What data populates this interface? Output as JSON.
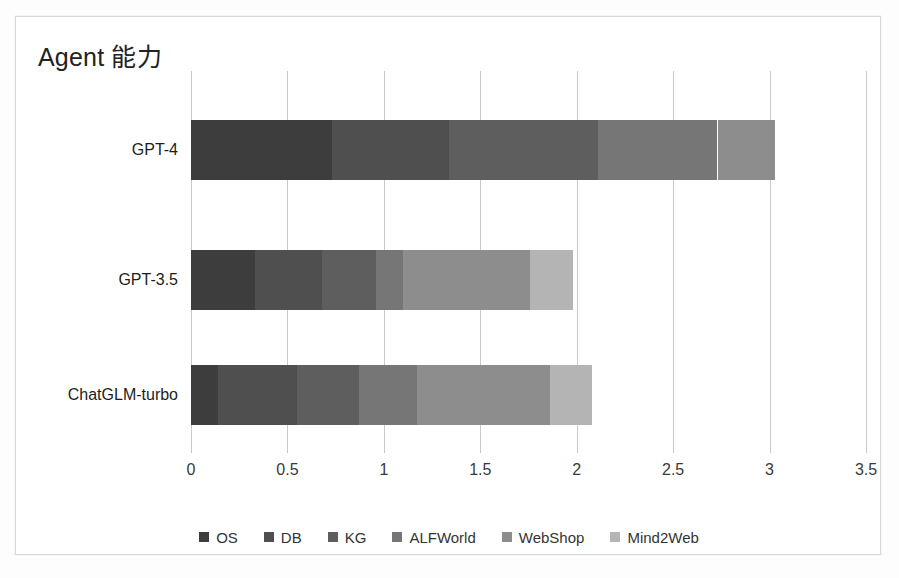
{
  "chart_data": {
    "type": "bar",
    "orientation": "horizontal",
    "stacked": true,
    "title": "Agent 能力",
    "xlabel": "",
    "ylabel": "",
    "xlim": [
      0,
      3.5
    ],
    "xticks": [
      "0",
      "0.5",
      "1",
      "1.5",
      "2",
      "2.5",
      "3",
      "3.5"
    ],
    "xtick_values": [
      0,
      0.5,
      1,
      1.5,
      2,
      2.5,
      3,
      3.5
    ],
    "grid": true,
    "legend_position": "bottom",
    "categories": [
      "GPT-4",
      "GPT-3.5",
      "ChatGLM-turbo"
    ],
    "series": [
      {
        "name": "OS",
        "color": "#3d3d3d",
        "values": [
          0.73,
          0.33,
          0.14
        ]
      },
      {
        "name": "DB",
        "color": "#4f4f4f",
        "values": [
          0.61,
          0.35,
          0.41
        ]
      },
      {
        "name": "KG",
        "color": "#5e5e5e",
        "values": [
          0.77,
          0.28,
          0.32
        ]
      },
      {
        "name": "ALFWorld",
        "color": "#767676",
        "values": [
          0.62,
          0.14,
          0.3
        ]
      },
      {
        "name": "WebShop",
        "color": "#8d8d8d",
        "values": [
          0.3,
          0.66,
          0.69
        ]
      },
      {
        "name": "Mind2Web",
        "color": "#b4b4b4",
        "values": [
          0.0,
          0.22,
          0.22
        ]
      }
    ],
    "totals": [
      3.03,
      1.98,
      2.08
    ]
  },
  "axis": {
    "grid_color": "#c9c9c9",
    "tick_label_color": "#3a3a3a"
  },
  "frame": {
    "border_color": "#d8d8d8",
    "background": "#ffffff"
  }
}
